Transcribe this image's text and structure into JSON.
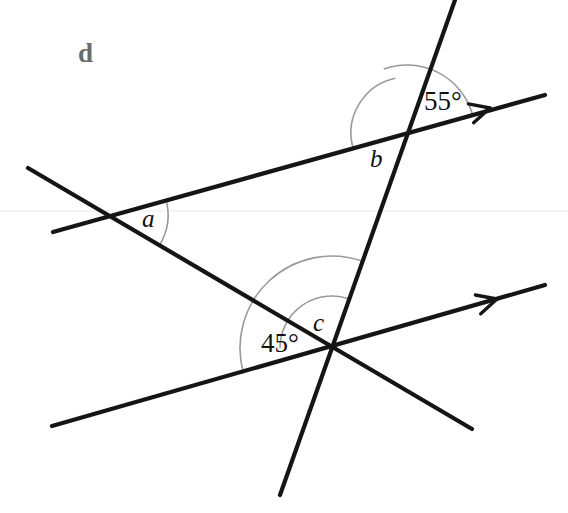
{
  "figure": {
    "part_label": "d",
    "background_color": "#ffffff",
    "line_color": "#151515",
    "arc_color": "#9a9a9a",
    "label_color": "#111111",
    "part_label_color": "#6b6b6b",
    "width": 568,
    "height": 513
  },
  "angles": [
    {
      "id": "a",
      "label": "a",
      "label_x": 142,
      "label_y": 206,
      "vertex_x": 110,
      "vertex_y": 215,
      "arc_radius": 58,
      "arc_start_deg": -16,
      "arc_end_deg": 31,
      "known": false
    },
    {
      "id": "b",
      "label": "b",
      "label_x": 370,
      "label_y": 146,
      "vertex_x": 407,
      "vertex_y": 133,
      "arc_radius": 56,
      "arc_start_deg": 164,
      "arc_end_deg": 258,
      "known": false
    },
    {
      "id": "55",
      "label": "55°",
      "label_x": 424,
      "label_y": 88,
      "vertex_x": 407,
      "vertex_y": 133,
      "arc_radius": 68,
      "arc_start_deg": -16,
      "arc_end_deg": -110,
      "known": true
    },
    {
      "id": "c",
      "label": "c",
      "label_x": 313,
      "label_y": 310,
      "vertex_x": 332,
      "vertex_y": 348,
      "arc_radius": 52,
      "arc_start_deg": 180,
      "arc_end_deg": 290,
      "known": false
    },
    {
      "id": "45",
      "label": "45°",
      "label_x": 261,
      "label_y": 330,
      "vertex_x": 332,
      "vertex_y": 348,
      "arc_radius": 92,
      "arc_start_deg": 164,
      "arc_end_deg": 290,
      "known": true
    }
  ],
  "chart_data": {
    "type": "diagram",
    "lines": [
      {
        "name": "upper-parallel-ray",
        "x1": 53,
        "y1": 232,
        "x2": 545,
        "y2": 95,
        "arrow": true,
        "arrow_x": 490,
        "arrow_y": 108,
        "stroke_width": 4.2
      },
      {
        "name": "lower-parallel-ray",
        "x1": 52,
        "y1": 426,
        "x2": 545,
        "y2": 285,
        "arrow": true,
        "arrow_x": 497,
        "arrow_y": 299,
        "stroke_width": 4.2
      },
      {
        "name": "transversal-line",
        "x1": 28,
        "y1": 168,
        "x2": 472,
        "y2": 429,
        "arrow": false,
        "stroke_width": 4.2
      },
      {
        "name": "steep-transversal-line",
        "x1": 455,
        "y1": 0,
        "x2": 280,
        "y2": 495,
        "arrow": false,
        "stroke_width": 4.2
      }
    ],
    "intersections": [
      {
        "name": "vertex-a",
        "x": 110,
        "y": 215,
        "angles": [
          "a"
        ]
      },
      {
        "name": "vertex-b",
        "x": 407,
        "y": 133,
        "angles": [
          "b",
          "55°"
        ]
      },
      {
        "name": "vertex-c",
        "x": 332,
        "y": 348,
        "angles": [
          "c",
          "45°"
        ]
      }
    ],
    "scan_artifact_line": {
      "name": "faint-horizontal-line",
      "y": 211,
      "color": "#f2eff0"
    }
  }
}
